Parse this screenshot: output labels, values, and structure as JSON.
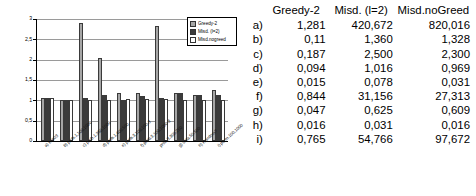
{
  "chart_data": {
    "type": "bar",
    "title": "",
    "xlabel": "",
    "ylabel": "apx.",
    "ylim": [
      0,
      3
    ],
    "yticks": [
      "0",
      "0,5",
      "1",
      "1,5",
      "2",
      "2,5",
      "3"
    ],
    "grid": true,
    "legend_position": "top-right",
    "categories": [
      "a) exp03",
      "b) prob.1,100,1000",
      "c) prob.1,350,1000",
      "d) prob.1,400,500",
      "e) prob.3,100,100-3",
      "f) prob.3,100,1000-3",
      "prob.3,300,250",
      "g) data.50,500",
      "h) Random?",
      "i) perm.100,1000"
    ],
    "series": [
      {
        "name": "Greedy-2",
        "color": "#a6a6a6",
        "values": [
          1.05,
          1.0,
          2.89,
          2.03,
          1.18,
          1.18,
          2.82,
          1.18,
          1.13,
          1.25
        ]
      },
      {
        "name": "Misd. (l=2)",
        "color": "#3b3b3b",
        "values": [
          1.05,
          1.0,
          1.05,
          1.13,
          1.01,
          1.1,
          1.07,
          1.18,
          1.13,
          1.12
        ]
      },
      {
        "name": "Misd.noGreed",
        "color": "#ffffff",
        "values": [
          1.05,
          1.0,
          1.0,
          1.0,
          1.03,
          1.03,
          1.04,
          1.0,
          1.0,
          1.0
        ]
      }
    ],
    "legend": [
      "Greedy-2",
      "Misd. (l=2)",
      "Misd.nogreed"
    ]
  },
  "table": {
    "headers": [
      "",
      "Greedy-2",
      "Misd. (l=2)",
      "Misd.noGreed"
    ],
    "rows": [
      {
        "label": "a)",
        "greedy2": "1,281",
        "misd_l2": "420,672",
        "misd_nogreed": "820,016"
      },
      {
        "label": "b)",
        "greedy2": "0,11",
        "misd_l2": "1,360",
        "misd_nogreed": "1,328"
      },
      {
        "label": "c)",
        "greedy2": "0,187",
        "misd_l2": "2,500",
        "misd_nogreed": "2,300"
      },
      {
        "label": "d)",
        "greedy2": "0,094",
        "misd_l2": "1,016",
        "misd_nogreed": "0,969"
      },
      {
        "label": "e)",
        "greedy2": "0,015",
        "misd_l2": "0,078",
        "misd_nogreed": "0,031"
      },
      {
        "label": "f)",
        "greedy2": "0,844",
        "misd_l2": "31,156",
        "misd_nogreed": "27,313"
      },
      {
        "label": "g)",
        "greedy2": "0,047",
        "misd_l2": "0,625",
        "misd_nogreed": "0,609"
      },
      {
        "label": "h)",
        "greedy2": "0,016",
        "misd_l2": "0,031",
        "misd_nogreed": "0,016"
      },
      {
        "label": "i)",
        "greedy2": "0,765",
        "misd_l2": "54,766",
        "misd_nogreed": "97,672"
      }
    ]
  }
}
